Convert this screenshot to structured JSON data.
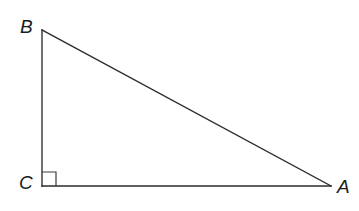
{
  "figure": {
    "kind": "geometry-diagram",
    "shape": "right-triangle",
    "canvas": {
      "width": 359,
      "height": 211,
      "background": "#ffffff"
    },
    "stroke_color": "#2b2b2b",
    "label_color": "#1c1c1c",
    "vertices": [
      {
        "id": "B",
        "label": "B",
        "x": 42,
        "y": 30
      },
      {
        "id": "C",
        "label": "C",
        "x": 42,
        "y": 186
      },
      {
        "id": "A",
        "label": "A",
        "x": 331,
        "y": 186
      }
    ],
    "edges": [
      {
        "id": "BC",
        "from": "B",
        "to": "C"
      },
      {
        "id": "CA",
        "from": "C",
        "to": "A"
      },
      {
        "id": "AB",
        "from": "A",
        "to": "B"
      }
    ],
    "right_angle": {
      "at": "C",
      "marker": "square",
      "size": 14,
      "x": 42,
      "y": 172
    },
    "polygon_points": "42,30 42,186 331,186"
  }
}
